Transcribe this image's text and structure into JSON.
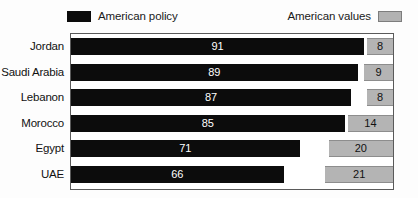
{
  "legend": {
    "policy_label": "American policy",
    "values_label": "American values",
    "policy_color": "#0c0c0c",
    "values_color": "#b4b4b4"
  },
  "chart_data": {
    "type": "bar",
    "orientation": "horizontal",
    "title": "",
    "subtitle": "",
    "xlabel": "",
    "ylabel": "",
    "xlim": [
      0,
      100
    ],
    "grid": false,
    "legend_position": "top",
    "categories": [
      "Jordan",
      "Saudi Arabia",
      "Lebanon",
      "Morocco",
      "Egypt",
      "UAE"
    ],
    "series": [
      {
        "name": "American policy",
        "color": "#0c0c0c",
        "align": "left",
        "values": [
          91,
          89,
          87,
          85,
          71,
          66
        ]
      },
      {
        "name": "American values",
        "color": "#b4b4b4",
        "align": "right",
        "values": [
          8,
          9,
          8,
          14,
          20,
          21
        ]
      }
    ]
  }
}
